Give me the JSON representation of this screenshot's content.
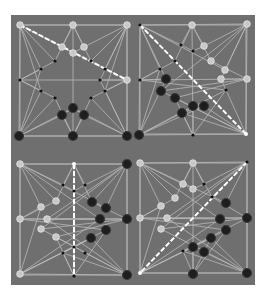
{
  "figure": {
    "background": "#6f6f6f",
    "line_color": "#b9b9b9",
    "light_piece_color": "#c8c8c8",
    "dark_piece_color": "#1e1e1e",
    "move_line_color": "#ffffff"
  },
  "panels": [
    {
      "name": "panel-top-left",
      "origin": [
        0,
        0
      ],
      "move": [
        [
          9,
          10
        ],
        [
          116,
          65
        ]
      ],
      "pieces": [
        {
          "p": [
            9,
            10
          ],
          "s": "light"
        },
        {
          "p": [
            62,
            10
          ],
          "s": "light"
        },
        {
          "p": [
            116,
            10
          ],
          "s": "light"
        },
        {
          "p": [
            9,
            65
          ],
          "s": "dot"
        },
        {
          "p": [
            116,
            65
          ],
          "s": "light"
        },
        {
          "p": [
            8,
            121
          ],
          "s": "dark"
        },
        {
          "p": [
            62,
            121
          ],
          "s": "dark"
        },
        {
          "p": [
            116,
            121
          ],
          "s": "dark"
        },
        {
          "p": [
            51,
            32
          ],
          "s": "light"
        },
        {
          "p": [
            73,
            32
          ],
          "s": "light"
        },
        {
          "p": [
            62,
            38
          ],
          "s": "light"
        },
        {
          "p": [
            44,
            46
          ],
          "s": "dot"
        },
        {
          "p": [
            80,
            46
          ],
          "s": "dot"
        },
        {
          "p": [
            30,
            54
          ],
          "s": "dot"
        },
        {
          "p": [
            94,
            54
          ],
          "s": "dot"
        },
        {
          "p": [
            89,
            65
          ],
          "s": "dot"
        },
        {
          "p": [
            30,
            76
          ],
          "s": "dot"
        },
        {
          "p": [
            94,
            76
          ],
          "s": "dot"
        },
        {
          "p": [
            44,
            83
          ],
          "s": "dot"
        },
        {
          "p": [
            80,
            83
          ],
          "s": "dot"
        },
        {
          "p": [
            62,
            93
          ],
          "s": "dark"
        },
        {
          "p": [
            51,
            100
          ],
          "s": "dark"
        },
        {
          "p": [
            73,
            100
          ],
          "s": "dark"
        }
      ]
    },
    {
      "name": "panel-top-right",
      "origin": [
        122,
        0
      ],
      "move": [
        [
          7,
          10
        ],
        [
          113,
          119
        ]
      ],
      "pieces": [
        {
          "p": [
            7,
            10
          ],
          "s": "dot"
        },
        {
          "p": [
            59,
            10
          ],
          "s": "light"
        },
        {
          "p": [
            114,
            9
          ],
          "s": "light"
        },
        {
          "p": [
            7,
            65
          ],
          "s": "dot"
        },
        {
          "p": [
            114,
            64
          ],
          "s": "light"
        },
        {
          "p": [
            6,
            120
          ],
          "s": "dark"
        },
        {
          "p": [
            60,
            120
          ],
          "s": "dot"
        },
        {
          "p": [
            113,
            119
          ],
          "s": "endpt"
        },
        {
          "p": [
            48,
            30
          ],
          "s": "dot"
        },
        {
          "p": [
            71,
            31
          ],
          "s": "light"
        },
        {
          "p": [
            60,
            36
          ],
          "s": "dot"
        },
        {
          "p": [
            42,
            46
          ],
          "s": "dot"
        },
        {
          "p": [
            78,
            46
          ],
          "s": "light"
        },
        {
          "p": [
            27,
            54
          ],
          "s": "dot"
        },
        {
          "p": [
            92,
            55
          ],
          "s": "light"
        },
        {
          "p": [
            88,
            64
          ],
          "s": "light"
        },
        {
          "p": [
            33,
            64
          ],
          "s": "dark"
        },
        {
          "p": [
            28,
            76
          ],
          "s": "dark"
        },
        {
          "p": [
            93,
            75
          ],
          "s": "dot"
        },
        {
          "p": [
            42,
            83
          ],
          "s": "dark"
        },
        {
          "p": [
            71,
            91
          ],
          "s": "dark"
        },
        {
          "p": [
            60,
            91
          ],
          "s": "dark"
        },
        {
          "p": [
            49,
            98
          ],
          "s": "dark"
        }
      ]
    },
    {
      "name": "panel-bottom-left",
      "origin": [
        0,
        135
      ],
      "move": [
        [
          63,
          14
        ],
        [
          63,
          124
        ]
      ],
      "pieces": [
        {
          "p": [
            9,
            14
          ],
          "s": "light"
        },
        {
          "p": [
            63,
            14
          ],
          "s": "endpt"
        },
        {
          "p": [
            116,
            14
          ],
          "s": "dark"
        },
        {
          "p": [
            9,
            69
          ],
          "s": "light"
        },
        {
          "p": [
            116,
            69
          ],
          "s": "dark"
        },
        {
          "p": [
            9,
            124
          ],
          "s": "light"
        },
        {
          "p": [
            63,
            126
          ],
          "s": "dot"
        },
        {
          "p": [
            116,
            125
          ],
          "s": "dark"
        },
        {
          "p": [
            52,
            35
          ],
          "s": "dot"
        },
        {
          "p": [
            74,
            35
          ],
          "s": "dot"
        },
        {
          "p": [
            63,
            41
          ],
          "s": "dot"
        },
        {
          "p": [
            45,
            51
          ],
          "s": "light"
        },
        {
          "p": [
            81,
            52
          ],
          "s": "dark"
        },
        {
          "p": [
            30,
            57
          ],
          "s": "light"
        },
        {
          "p": [
            95,
            58
          ],
          "s": "dark"
        },
        {
          "p": [
            36,
            69
          ],
          "s": "light"
        },
        {
          "p": [
            89,
            69
          ],
          "s": "dark"
        },
        {
          "p": [
            30,
            79
          ],
          "s": "light"
        },
        {
          "p": [
            95,
            80
          ],
          "s": "dark"
        },
        {
          "p": [
            45,
            87
          ],
          "s": "light"
        },
        {
          "p": [
            80,
            88
          ],
          "s": "dark"
        },
        {
          "p": [
            63,
            97
          ],
          "s": "dot"
        },
        {
          "p": [
            52,
            103
          ],
          "s": "dot"
        },
        {
          "p": [
            74,
            103
          ],
          "s": "dot"
        }
      ]
    },
    {
      "name": "panel-bottom-right",
      "origin": [
        122,
        135
      ],
      "move": [
        [
          114,
          12
        ],
        [
          7,
          123
        ]
      ],
      "pieces": [
        {
          "p": [
            7,
            13
          ],
          "s": "light"
        },
        {
          "p": [
            60,
            13
          ],
          "s": "light"
        },
        {
          "p": [
            114,
            12
          ],
          "s": "dot"
        },
        {
          "p": [
            7,
            68
          ],
          "s": "light"
        },
        {
          "p": [
            114,
            68
          ],
          "s": "dark"
        },
        {
          "p": [
            7,
            123
          ],
          "s": "endpt"
        },
        {
          "p": [
            60,
            124
          ],
          "s": "dark"
        },
        {
          "p": [
            114,
            123
          ],
          "s": "dark"
        },
        {
          "p": [
            50,
            34
          ],
          "s": "light"
        },
        {
          "p": [
            71,
            34
          ],
          "s": "dot"
        },
        {
          "p": [
            60,
            39
          ],
          "s": "light"
        },
        {
          "p": [
            42,
            48
          ],
          "s": "light"
        },
        {
          "p": [
            79,
            47
          ],
          "s": "dot"
        },
        {
          "p": [
            28,
            56
          ],
          "s": "light"
        },
        {
          "p": [
            93,
            53
          ],
          "s": "dark"
        },
        {
          "p": [
            34,
            68
          ],
          "s": "light"
        },
        {
          "p": [
            87,
            69
          ],
          "s": "dark"
        },
        {
          "p": [
            28,
            79
          ],
          "s": "light"
        },
        {
          "p": [
            93,
            80
          ],
          "s": "dark"
        },
        {
          "p": [
            50,
            101
          ],
          "s": "dot"
        },
        {
          "p": [
            78,
            88
          ],
          "s": "dark"
        },
        {
          "p": [
            60,
            97
          ],
          "s": "dark"
        },
        {
          "p": [
            71,
            102
          ],
          "s": "dark"
        }
      ]
    }
  ]
}
